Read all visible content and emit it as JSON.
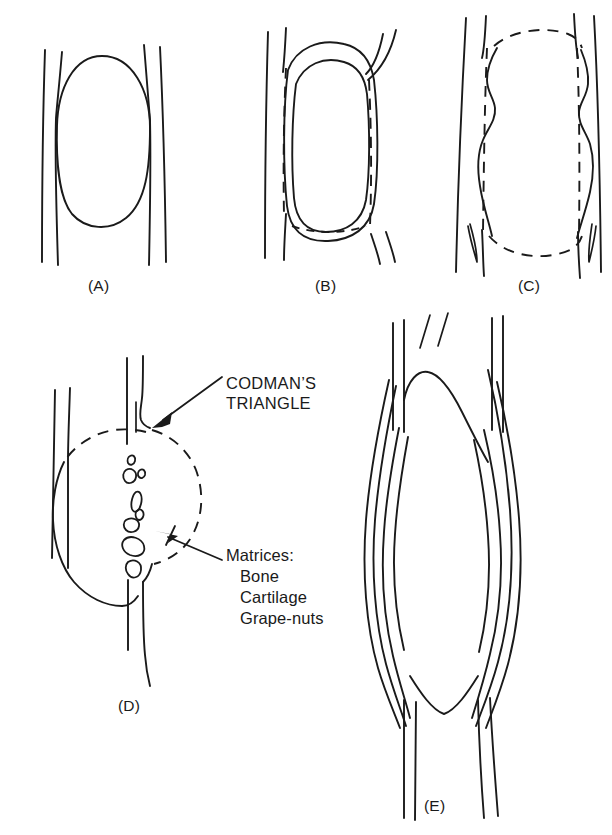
{
  "figure": {
    "background_color": "#ffffff",
    "ink_color": "#1a1a1a"
  },
  "panels": [
    {
      "id": "A",
      "label": "(A)",
      "description": "Geographic lytic lesion within bone shaft, intact cortex, narrow zone of transition"
    },
    {
      "id": "B",
      "label": "(B)",
      "description": "Expansile lesion with thinned remodelled cortex; dashed line marks original cortical margin"
    },
    {
      "id": "C",
      "label": "(C)",
      "description": "Markedly expansile lobulated lesion with dashed margins and scalloped endosteum"
    },
    {
      "id": "D",
      "label": "(D)",
      "description": "Aggressive destructive lesion with cortical breakthrough, Codman's triangle and tumour matrix"
    },
    {
      "id": "E",
      "label": "(E)",
      "description": "Laminated onion-skin periosteal reaction along the shaft"
    }
  ],
  "annotations": {
    "codman": {
      "line1": "CODMAN’S",
      "line2": "TRIANGLE"
    },
    "matrices": {
      "heading": "Matrices:",
      "items": [
        "Bone",
        "Cartilage",
        "Grape-nuts"
      ]
    }
  }
}
